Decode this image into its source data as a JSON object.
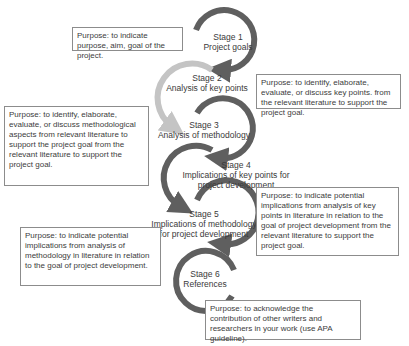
{
  "colors": {
    "dark_arc": "#5f5f5f",
    "light_arc": "#c4c4c4",
    "box_border": "#8c8c8c",
    "text": "#3a3a3a"
  },
  "stages": [
    {
      "number": "Stage 1",
      "title_lines": [
        "Project goals"
      ]
    },
    {
      "number": "Stage 2",
      "title_lines": [
        "Analysis of key points"
      ]
    },
    {
      "number": "Stage 3",
      "title_lines": [
        "Analysis of methodology"
      ]
    },
    {
      "number": "Stage 4",
      "title_lines": [
        "Implications of key points for",
        "project development"
      ]
    },
    {
      "number": "Stage 5",
      "title_lines": [
        "Implications of methodology",
        "for project development"
      ]
    },
    {
      "number": "Stage 6",
      "title_lines": [
        "References"
      ]
    }
  ],
  "purposes": [
    {
      "stage": "Stage 1",
      "text": "Purpose: to indicate purpose, aim, goal of the project."
    },
    {
      "stage": "Stage 2",
      "text": "Purpose: to identify, elaborate, evaluate, or discuss key points. from the relevant literature to support the project goal."
    },
    {
      "stage": "Stage 3",
      "text": "Purpose: to identify, elaborate, evaluate, or discuss methodological aspects from relevant literature to support the project goal from the relevant literature to support the project goal."
    },
    {
      "stage": "Stage 4",
      "text": "Purpose: to indicate potential implications from analysis of key points in literature in relation to the goal of project development from the relevant literature to support the project goal."
    },
    {
      "stage": "Stage 5",
      "text": "Purpose: to indicate potential implications from analysis of methodology in literature in relation to the goal of project development."
    },
    {
      "stage": "Stage 6",
      "text": "Purpose: to acknowledge the contribution of other writers and researchers in your work (use APA guideline)."
    }
  ]
}
